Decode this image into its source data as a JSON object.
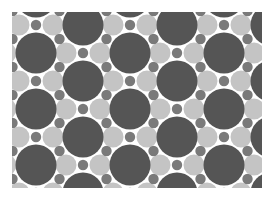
{
  "canvas": {
    "width": 275,
    "height": 201,
    "background": "#ffffff"
  },
  "pattern": {
    "name": "polka-dot-circle-pattern",
    "frame": {
      "x": 12,
      "y": 12,
      "width": 250,
      "height": 176
    },
    "period": {
      "dx": 94,
      "dy": 56
    },
    "colors": {
      "big": "#555555",
      "small": "#7a7a7a",
      "light": "#c4c4c4"
    },
    "radii": {
      "big": 20.5,
      "small": 5.2,
      "light": 10.5
    },
    "lightOffset": 17,
    "latticeOrigins": [
      {
        "x": 36,
        "y": -3
      },
      {
        "x": 83,
        "y": 25
      }
    ]
  }
}
